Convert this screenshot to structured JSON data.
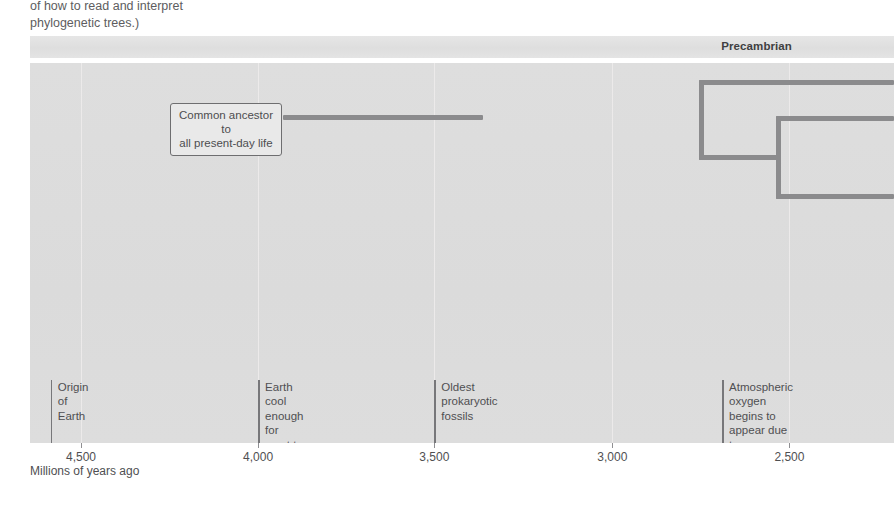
{
  "caption": {
    "text": "of how to read and interpret\nphylogenetic trees.)"
  },
  "era_band": {
    "label": "Precambrian",
    "label_x_pct": 84.1,
    "color": "#e2e2e2"
  },
  "callout": {
    "text": "Common ancestor to\nall present-day life"
  },
  "axis": {
    "title": "Millions of years ago",
    "ticks": [
      {
        "label": "4,500",
        "value": 4500,
        "x_pct": 5.9
      },
      {
        "label": "4,000",
        "value": 4000,
        "x_pct": 26.4
      },
      {
        "label": "3,500",
        "value": 3500,
        "x_pct": 46.8
      },
      {
        "label": "3,000",
        "value": 3000,
        "x_pct": 67.4
      },
      {
        "label": "2,500",
        "value": 2500,
        "x_pct": 87.9
      }
    ]
  },
  "events": [
    {
      "name": "origin-of-earth",
      "text": "Origin of\nEarth",
      "x_pct": 2.4,
      "rule_height_pct": 16.6,
      "text_top_pct": 83.4
    },
    {
      "name": "crust-solidify",
      "text": "Earth cool enough for\ncrust to solidify",
      "x_pct": 26.4,
      "rule_height_pct": 16.6,
      "text_top_pct": 83.4
    },
    {
      "name": "oldest-prokaryotic-fossils",
      "text": "Oldest prokaryotic fossils",
      "x_pct": 46.8,
      "rule_height_pct": 16.6,
      "text_top_pct": 83.4
    },
    {
      "name": "atmospheric-oxygen",
      "text": "Atmospheric oxygen\nbegins to appear due\nto photosynthetic\nprokaryotes",
      "x_pct": 80.1,
      "rule_height_pct": 16.6,
      "text_top_pct": 83.4
    }
  ],
  "chart_data": {
    "type": "line",
    "xlabel": "Millions of years ago",
    "ylabel": "",
    "xlim": [
      4700,
      2350
    ],
    "grid": true,
    "legend": "none",
    "tree_color": "#8b8b8d",
    "nodes": [
      {
        "id": "root",
        "label": "Common ancestor to all present-day life",
        "time_mya": 4215
      },
      {
        "id": "node-1",
        "label": "",
        "time_mya": 2685
      },
      {
        "id": "node-2",
        "label": "",
        "time_mya": 2470
      }
    ],
    "branches": [
      {
        "id": "trunk",
        "from_mya": 4215,
        "to_mya": 2685,
        "y_px": 117
      },
      {
        "id": "node-1-stem",
        "from_mya": 2685,
        "to_mya": 2685,
        "y_from_px": 82,
        "y_to_px": 157
      },
      {
        "id": "node-1-upper",
        "from_mya": 2685,
        "to_mya": 2350,
        "y_px": 82
      },
      {
        "id": "node-1-lower",
        "from_mya": 2685,
        "to_mya": 2470,
        "y_px": 157
      },
      {
        "id": "node-2-stem",
        "from_mya": 2470,
        "to_mya": 2470,
        "y_from_px": 118,
        "y_to_px": 196
      },
      {
        "id": "node-2-upper",
        "from_mya": 2470,
        "to_mya": 2350,
        "y_px": 118
      },
      {
        "id": "node-2-lower",
        "from_mya": 2470,
        "to_mya": 2350,
        "y_px": 196
      }
    ],
    "annotations": [
      {
        "label": "Origin of Earth",
        "time_mya": 4580
      },
      {
        "label": "Earth cool enough for crust to solidify",
        "time_mya": 4000
      },
      {
        "label": "Oldest prokaryotic fossils",
        "time_mya": 3500
      },
      {
        "label": "Atmospheric oxygen begins to appear due to photosynthetic prokaryotes",
        "time_mya": 2740
      }
    ]
  }
}
